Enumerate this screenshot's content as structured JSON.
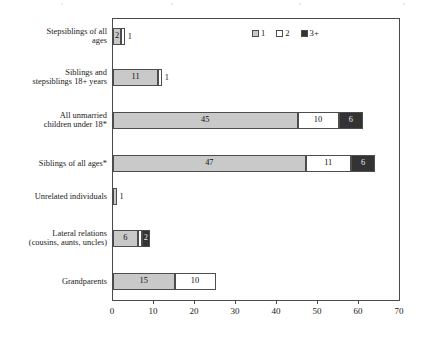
{
  "chart_data": {
    "type": "bar",
    "orientation": "horizontal",
    "stacked": true,
    "title": "",
    "xlabel": "",
    "ylabel": "",
    "xlim": [
      0,
      70
    ],
    "xticks": [
      0,
      10,
      20,
      30,
      40,
      50,
      60,
      70
    ],
    "grid": false,
    "legend_position": "top-right",
    "legend": [
      "1",
      "2",
      "3+"
    ],
    "colors": {
      "series_1": "#c9c9c9",
      "series_2": "#ffffff",
      "series_3": "#333333",
      "outline": "#4d4d4d",
      "frame": "#4a4a4a"
    },
    "categories": [
      "Stepsiblings of all ages",
      "Siblings and stepsiblings 18+ years",
      "All unmarried children under 18*",
      "Siblings of all ages*",
      "Unrelated individuals",
      "Lateral relations (cousins, aunts, uncles)",
      "Grandparents"
    ],
    "series": [
      {
        "name": "1",
        "values": [
          2,
          11,
          45,
          47,
          1,
          6,
          15
        ]
      },
      {
        "name": "2",
        "values": [
          1,
          1,
          10,
          11,
          0,
          1,
          10
        ]
      },
      {
        "name": "3+",
        "values": [
          0,
          0,
          6,
          6,
          0,
          2,
          0
        ]
      }
    ]
  },
  "chart": {
    "legend": [
      {
        "label": "1",
        "swatch": "c1"
      },
      {
        "label": "2",
        "swatch": "c2"
      },
      {
        "label": "3+",
        "swatch": "c3"
      }
    ],
    "xticks": [
      {
        "label": "0",
        "value": 0
      },
      {
        "label": "10",
        "value": 10
      },
      {
        "label": "20",
        "value": 20
      },
      {
        "label": "30",
        "value": 30
      },
      {
        "label": "40",
        "value": 40
      },
      {
        "label": "50",
        "value": 50
      },
      {
        "label": "60",
        "value": 60
      },
      {
        "label": "70",
        "value": 70
      }
    ],
    "rows": [
      {
        "label_lines": [
          "Stepsiblings of all",
          "ages"
        ],
        "segments": [
          {
            "cls": "c1",
            "value": 2,
            "label": "2",
            "inside": true
          },
          {
            "cls": "c2",
            "value": 1,
            "label": "1",
            "inside": false
          }
        ]
      },
      {
        "label_lines": [
          "Siblings and",
          "stepsiblings 18+ years"
        ],
        "segments": [
          {
            "cls": "c1",
            "value": 11,
            "label": "11",
            "inside": true
          },
          {
            "cls": "c2",
            "value": 1,
            "label": "1",
            "inside": false
          }
        ]
      },
      {
        "label_lines": [
          "All unmarried",
          "children under 18*"
        ],
        "segments": [
          {
            "cls": "c1",
            "value": 45,
            "label": "45",
            "inside": true
          },
          {
            "cls": "c2",
            "value": 10,
            "label": "10",
            "inside": true
          },
          {
            "cls": "c3",
            "value": 6,
            "label": "6",
            "inside": true
          }
        ]
      },
      {
        "label_lines": [
          "Siblings of all ages*"
        ],
        "segments": [
          {
            "cls": "c1",
            "value": 47,
            "label": "47",
            "inside": true
          },
          {
            "cls": "c2",
            "value": 11,
            "label": "11",
            "inside": true
          },
          {
            "cls": "c3",
            "value": 6,
            "label": "6",
            "inside": true
          }
        ]
      },
      {
        "label_lines": [
          "Unrelated individuals"
        ],
        "segments": [
          {
            "cls": "c1",
            "value": 1,
            "label": "1",
            "inside": false
          }
        ]
      },
      {
        "label_lines": [
          "Lateral relations",
          "(cousins, aunts, uncles)"
        ],
        "segments": [
          {
            "cls": "c1",
            "value": 6,
            "label": "6",
            "inside": true
          },
          {
            "cls": "c2",
            "value": 1,
            "label": "",
            "inside": true
          },
          {
            "cls": "c3",
            "value": 2,
            "label": "2",
            "inside": true
          }
        ]
      },
      {
        "label_lines": [
          "Grandparents"
        ],
        "segments": [
          {
            "cls": "c1",
            "value": 15,
            "label": "15",
            "inside": true
          },
          {
            "cls": "c2",
            "value": 10,
            "label": "10",
            "inside": true
          }
        ]
      }
    ]
  }
}
